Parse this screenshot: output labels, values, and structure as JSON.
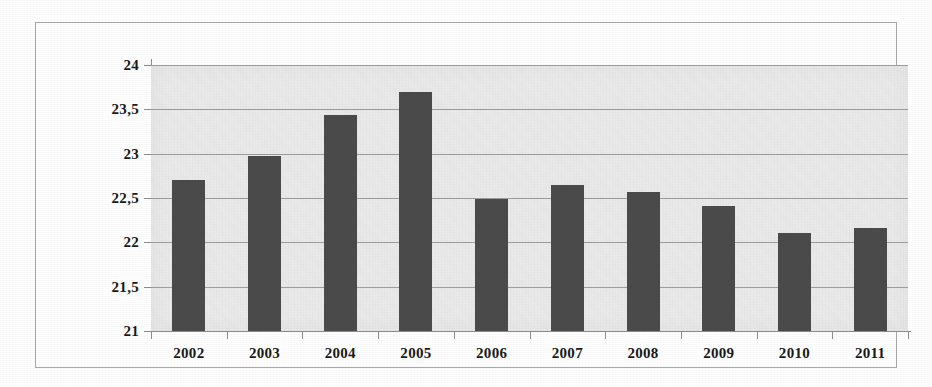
{
  "chart_data": {
    "type": "bar",
    "title": "",
    "subtitle": "",
    "xlabel": "",
    "ylabel": "",
    "categories": [
      "2002",
      "2003",
      "2004",
      "2005",
      "2006",
      "2007",
      "2008",
      "2009",
      "2010",
      "2011"
    ],
    "values": [
      22.7,
      22.97,
      23.44,
      23.7,
      22.49,
      22.65,
      22.57,
      22.41,
      22.1,
      22.16
    ],
    "series": [
      {
        "name": "",
        "values": [
          22.7,
          22.97,
          23.44,
          23.7,
          22.49,
          22.65,
          22.57,
          22.41,
          22.1,
          22.16
        ]
      }
    ],
    "ylim": [
      21,
      24
    ],
    "ytick_labels": [
      "24",
      "23,5",
      "23",
      "22,5",
      "22",
      "21,5",
      "21"
    ],
    "ytick_values": [
      24,
      23.5,
      23,
      22.5,
      22,
      21.5,
      21
    ],
    "grid": true,
    "legend": "none",
    "decimal_separator": ",",
    "bar_color": "#4b4b4b",
    "plot_background": "#ebebeb",
    "gridline_color": "#9d9d9d",
    "axis_color": "#8c8c8c",
    "frame_color": "#a8a8a8",
    "text_color": "#1a1a1a"
  }
}
